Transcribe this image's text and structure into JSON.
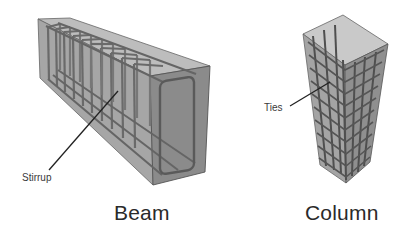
{
  "diagram": {
    "beam": {
      "title": "Beam",
      "callout": "Stirrup",
      "callout_target": "stirrup"
    },
    "column": {
      "title": "Column",
      "callout": "Ties",
      "callout_target": "ties"
    }
  },
  "colors": {
    "background": "#ffffff",
    "concrete_front": "#8c8c8c",
    "concrete_side": "#a9a9a9",
    "concrete_top": "#bcbcbc",
    "rebar": "#5e5e5e",
    "edge": "#555555",
    "leader_line": "#222222",
    "label_text": "#333333"
  }
}
